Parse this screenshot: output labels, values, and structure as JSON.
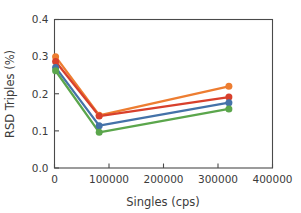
{
  "chart_data": {
    "type": "line",
    "title": "",
    "xlabel": "Singles (cps)",
    "ylabel": "RSD Triples (%)",
    "xlim": [
      0,
      400000
    ],
    "ylim": [
      0.0,
      0.4
    ],
    "grid": false,
    "legend": "none",
    "xticks": [
      0,
      100000,
      200000,
      300000,
      400000
    ],
    "xtick_labels": [
      "0",
      "100000",
      "200000",
      "300000",
      "400000"
    ],
    "yticks": [
      0.0,
      0.1,
      0.2,
      0.3,
      0.4
    ],
    "ytick_labels": [
      "0.0",
      "0.1",
      "0.2",
      "0.3",
      "0.4"
    ],
    "x": [
      2000,
      82000,
      320000
    ],
    "series": [
      {
        "name": "series-orange",
        "color": "#ED7D31",
        "values": [
          0.3,
          0.142,
          0.22
        ]
      },
      {
        "name": "series-red",
        "color": "#D8402C",
        "values": [
          0.287,
          0.14,
          0.191
        ]
      },
      {
        "name": "series-blue",
        "color": "#4472A8",
        "values": [
          0.271,
          0.114,
          0.176
        ]
      },
      {
        "name": "series-green",
        "color": "#5BA64C",
        "values": [
          0.262,
          0.096,
          0.159
        ]
      }
    ]
  },
  "colors": {
    "axis": "#4a4a4a",
    "text": "#3b3b3b",
    "background": "#ffffff"
  }
}
